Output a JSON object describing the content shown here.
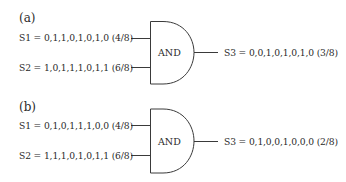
{
  "panels": [
    {
      "label": "(a)",
      "gate": "AND",
      "inputs": [
        {
          "text": "S1 = 0,1,1,0,1,0,1,0 (4/8)"
        },
        {
          "text": "S2 = 1,0,1,1,1,0,1,1 (6/8)"
        }
      ],
      "output": {
        "text": "S3 = 0,0,1,0,1,0,1,0 (3/8)"
      }
    },
    {
      "label": "(b)",
      "gate": "AND",
      "inputs": [
        {
          "text": "S1 = 0,1,0,1,1,1,0,0 (4/8)"
        },
        {
          "text": "S2 = 1,1,1,0,1,0,1,1 (6/8)"
        }
      ],
      "output": {
        "text": "S3 = 0,1,0,0,1,0,0,0 (2/8)"
      }
    }
  ],
  "colors": {
    "line": "#3a3a3a",
    "text": "#2a2a2a",
    "background": "#ffffff"
  }
}
